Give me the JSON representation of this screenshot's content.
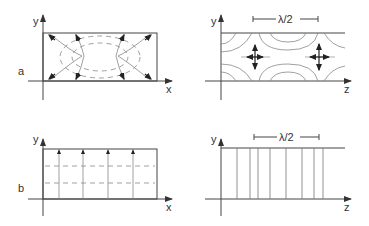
{
  "figure": {
    "panel_a": {
      "label": "a",
      "left": {
        "y_axis_label": "y",
        "x_axis_label": "x"
      },
      "right": {
        "y_axis_label": "y",
        "z_axis_label": "z",
        "dimension_label": "λ/2"
      }
    },
    "panel_b": {
      "label": "b",
      "left": {
        "y_axis_label": "y",
        "x_axis_label": "x"
      },
      "right": {
        "y_axis_label": "y",
        "z_axis_label": "z",
        "dimension_label": "λ/2"
      }
    }
  },
  "colors": {
    "line": "#444444",
    "field_line": "#888888",
    "arrow": "#222222",
    "background": "#ffffff"
  }
}
